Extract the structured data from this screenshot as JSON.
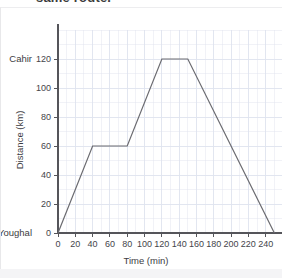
{
  "title": "same route.",
  "chart_data": {
    "type": "line",
    "title": "same route.",
    "xlabel": "Time (min)",
    "ylabel": "Distance (km)",
    "xlim": [
      0,
      260
    ],
    "ylim": [
      0,
      140
    ],
    "xticks": [
      0,
      20,
      40,
      60,
      80,
      100,
      120,
      140,
      160,
      180,
      200,
      220,
      240
    ],
    "yticks": [
      0,
      20,
      40,
      60,
      80,
      100,
      120
    ],
    "xtick_labels": [
      "0",
      "20",
      "40",
      "60",
      "80",
      "100",
      "120",
      "140",
      "160",
      "180",
      "200",
      "220",
      "240"
    ],
    "ytick_labels": [
      "0",
      "20",
      "40",
      "60",
      "80",
      "100",
      "120"
    ],
    "grid": true,
    "grid_minor_step_x": 10,
    "grid_minor_step_y": 10,
    "legend": "none",
    "line_color": "#6b6b70",
    "grid_color": "#dfe3ee",
    "axis_color": "#55555a",
    "x": [
      0,
      40,
      80,
      120,
      150,
      250
    ],
    "y": [
      0,
      60,
      60,
      120,
      120,
      0
    ],
    "points": [
      {
        "x": 0,
        "y": 0
      },
      {
        "x": 40,
        "y": 60
      },
      {
        "x": 80,
        "y": 60
      },
      {
        "x": 120,
        "y": 120
      },
      {
        "x": 150,
        "y": 120
      },
      {
        "x": 250,
        "y": 0
      }
    ],
    "annotations": [
      {
        "text": "Cahir",
        "axis": "y",
        "value": 120
      },
      {
        "text": "Youghal",
        "axis": "y",
        "value": 0
      }
    ]
  },
  "axis": {
    "y_place_top": "Cahir",
    "y_place_bottom": "Youghal",
    "x_title": "Time (min)",
    "y_title": "Distance (km)"
  }
}
